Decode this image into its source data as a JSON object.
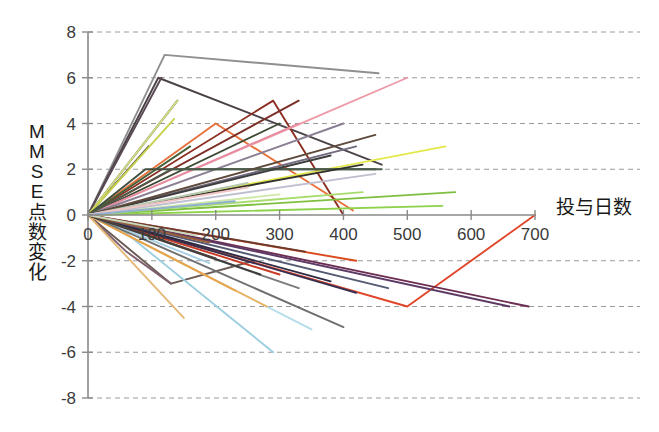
{
  "chart_data": {
    "type": "line",
    "title": "",
    "subtitle": "",
    "xlabel": "投与日数",
    "ylabel": "MMSE 点数変化",
    "ylabel_chars": [
      "M",
      "M",
      "S",
      "E",
      "点",
      "数",
      "変",
      "化"
    ],
    "xlim": [
      0,
      700
    ],
    "ylim": [
      -8,
      8
    ],
    "xticks": [
      0,
      100,
      200,
      300,
      400,
      500,
      600,
      700
    ],
    "xticklabels": [
      "0",
      "100",
      "200",
      "300",
      "400",
      "500",
      "600",
      "700"
    ],
    "yticks": [
      8,
      6,
      4,
      2,
      0,
      -2,
      -4,
      -6,
      -8
    ],
    "yticklabels": [
      "8",
      "6",
      "4",
      "2",
      "0",
      "-2",
      "-4",
      "-6",
      "-8"
    ],
    "grid": "horizontal-dashed",
    "legend": "none",
    "series": [
      {
        "name": "s01",
        "color": "#8f8f8f",
        "x": [
          0,
          120,
          455
        ],
        "y": [
          0,
          7,
          6.2
        ]
      },
      {
        "name": "s02",
        "color": "#4a4247",
        "x": [
          0,
          110,
          460
        ],
        "y": [
          0,
          6,
          2.2
        ]
      },
      {
        "name": "s03",
        "color": "#5a4a55",
        "x": [
          0,
          115
        ],
        "y": [
          0,
          6
        ]
      },
      {
        "name": "s04",
        "color": "#2f2f2f",
        "x": [
          0,
          140
        ],
        "y": [
          0,
          5
        ]
      },
      {
        "name": "s05",
        "color": "#3b3030",
        "x": [
          0,
          95
        ],
        "y": [
          0,
          3
        ]
      },
      {
        "name": "s06",
        "color": "#d4de80",
        "x": [
          0,
          140
        ],
        "y": [
          0,
          5
        ]
      },
      {
        "name": "s07",
        "color": "#c9d24f",
        "x": [
          0,
          135
        ],
        "y": [
          0,
          4.2
        ]
      },
      {
        "name": "s08",
        "color": "#e8703a",
        "x": [
          0,
          200,
          415
        ],
        "y": [
          0,
          4,
          0.2
        ]
      },
      {
        "name": "s09",
        "color": "#8c2f22",
        "x": [
          0,
          290,
          400
        ],
        "y": [
          0,
          5,
          0
        ]
      },
      {
        "name": "s10",
        "color": "#7a2e26",
        "x": [
          0,
          330
        ],
        "y": [
          0,
          5
        ]
      },
      {
        "name": "s11",
        "color": "#46613a",
        "x": [
          0,
          160
        ],
        "y": [
          0,
          3
        ]
      },
      {
        "name": "s12",
        "color": "#3d4a33",
        "x": [
          0,
          300
        ],
        "y": [
          0,
          4
        ]
      },
      {
        "name": "s13",
        "color": "#ed9aa8",
        "x": [
          0,
          500
        ],
        "y": [
          0,
          6
        ]
      },
      {
        "name": "s14",
        "color": "#e78ca0",
        "x": [
          0,
          330
        ],
        "y": [
          0,
          4
        ]
      },
      {
        "name": "s15",
        "color": "#8a7f93",
        "x": [
          0,
          400
        ],
        "y": [
          0,
          4
        ]
      },
      {
        "name": "s16",
        "color": "#736a7d",
        "x": [
          0,
          420
        ],
        "y": [
          0,
          3
        ]
      },
      {
        "name": "s17",
        "color": "#e4e84a",
        "x": [
          0,
          560
        ],
        "y": [
          0,
          3
        ]
      },
      {
        "name": "s18",
        "color": "#3f4f3f",
        "x": [
          0,
          90,
          450
        ],
        "y": [
          0,
          2,
          2
        ]
      },
      {
        "name": "s19",
        "color": "#4c5c4c",
        "x": [
          0,
          130,
          460
        ],
        "y": [
          0,
          2,
          2
        ]
      },
      {
        "name": "s20",
        "color": "#3e3e3e",
        "x": [
          0,
          380
        ],
        "y": [
          0,
          2.6
        ]
      },
      {
        "name": "s21",
        "color": "#32322c",
        "x": [
          0,
          430
        ],
        "y": [
          0,
          2.2
        ]
      },
      {
        "name": "s22",
        "color": "#5e4a3c",
        "x": [
          0,
          450
        ],
        "y": [
          0,
          3.5
        ]
      },
      {
        "name": "s23",
        "color": "#7fbf3f",
        "x": [
          0,
          575
        ],
        "y": [
          0,
          1
        ]
      },
      {
        "name": "s24",
        "color": "#8dd24a",
        "x": [
          0,
          555
        ],
        "y": [
          0,
          0.4
        ]
      },
      {
        "name": "s25",
        "color": "#a9dc6e",
        "x": [
          0,
          430
        ],
        "y": [
          0,
          1
        ]
      },
      {
        "name": "s26",
        "color": "#cfe8a8",
        "x": [
          0,
          300
        ],
        "y": [
          0,
          0.9
        ]
      },
      {
        "name": "s27",
        "color": "#b7c9b0",
        "x": [
          0,
          250
        ],
        "y": [
          0,
          1.4
        ]
      },
      {
        "name": "s28",
        "color": "#bfbfd0",
        "x": [
          0,
          450
        ],
        "y": [
          0,
          1.8
        ]
      },
      {
        "name": "s29",
        "color": "#f0c4c4",
        "x": [
          0,
          250
        ],
        "y": [
          0,
          1.2
        ]
      },
      {
        "name": "s30",
        "color": "#8fb0d0",
        "x": [
          0,
          230
        ],
        "y": [
          0,
          0.6
        ]
      },
      {
        "name": "s31",
        "color": "#6b5a52",
        "x": [
          0,
          130,
          260
        ],
        "y": [
          0,
          -3,
          -2
        ]
      },
      {
        "name": "s32",
        "color": "#7d5f6e",
        "x": [
          0,
          60,
          130
        ],
        "y": [
          0,
          -1.6,
          -3
        ]
      },
      {
        "name": "s33",
        "color": "#9ecfe0",
        "x": [
          0,
          60,
          290
        ],
        "y": [
          0,
          -0.8,
          -6
        ]
      },
      {
        "name": "s34",
        "color": "#b3dceb",
        "x": [
          0,
          350
        ],
        "y": [
          0,
          -5
        ]
      },
      {
        "name": "s35",
        "color": "#a8cfe4",
        "x": [
          0,
          190
        ],
        "y": [
          0,
          -2.1
        ]
      },
      {
        "name": "s36",
        "color": "#e5b878",
        "x": [
          0,
          150
        ],
        "y": [
          0,
          -4.5
        ]
      },
      {
        "name": "s37",
        "color": "#edb25a",
        "x": [
          0,
          280
        ],
        "y": [
          0,
          -4
        ]
      },
      {
        "name": "s38",
        "color": "#e8a44a",
        "x": [
          0,
          230
        ],
        "y": [
          0,
          -3.3
        ]
      },
      {
        "name": "s39",
        "color": "#d94b1e",
        "x": [
          0,
          420
        ],
        "y": [
          0,
          -2
        ]
      },
      {
        "name": "s40",
        "color": "#e0472a",
        "x": [
          0,
          500,
          700
        ],
        "y": [
          0,
          -4,
          0
        ]
      },
      {
        "name": "s41",
        "color": "#c93b22",
        "x": [
          0,
          300
        ],
        "y": [
          0,
          -2.6
        ]
      },
      {
        "name": "s42",
        "color": "#6c2d52",
        "x": [
          0,
          690
        ],
        "y": [
          0,
          -4
        ]
      },
      {
        "name": "s43",
        "color": "#5d3a66",
        "x": [
          0,
          660
        ],
        "y": [
          0,
          -4
        ]
      },
      {
        "name": "s44",
        "color": "#3a2f4f",
        "x": [
          0,
          420
        ],
        "y": [
          0,
          -3.4
        ]
      },
      {
        "name": "s45",
        "color": "#2f2a44",
        "x": [
          0,
          380
        ],
        "y": [
          0,
          -2.9
        ]
      },
      {
        "name": "s46",
        "color": "#555a73",
        "x": [
          0,
          470
        ],
        "y": [
          0,
          -3.2
        ]
      },
      {
        "name": "s47",
        "color": "#6f6f6f",
        "x": [
          0,
          400
        ],
        "y": [
          0,
          -4.9
        ]
      },
      {
        "name": "s48",
        "color": "#7b7b7b",
        "x": [
          0,
          330
        ],
        "y": [
          0,
          -3.2
        ]
      },
      {
        "name": "s49",
        "color": "#3c3c3c",
        "x": [
          0,
          270
        ],
        "y": [
          0,
          -2.6
        ]
      },
      {
        "name": "s50",
        "color": "#4b3f3a",
        "x": [
          0,
          200
        ],
        "y": [
          0,
          -1.9
        ]
      },
      {
        "name": "s51",
        "color": "#6d3b2e",
        "x": [
          0,
          340
        ],
        "y": [
          0,
          -1.6
        ]
      },
      {
        "name": "s52",
        "color": "#9a5e3a",
        "x": [
          0,
          190
        ],
        "y": [
          0,
          -1.2
        ]
      },
      {
        "name": "s53",
        "color": "#c8d8c0",
        "x": [
          0,
          170
        ],
        "y": [
          0,
          -0.9
        ]
      }
    ]
  },
  "axes_style": {
    "axis_color": "#8a8a8a",
    "grid_color": "#9a9a9a",
    "tick_label_color": "#3a3a3a",
    "background": "#ffffff"
  }
}
